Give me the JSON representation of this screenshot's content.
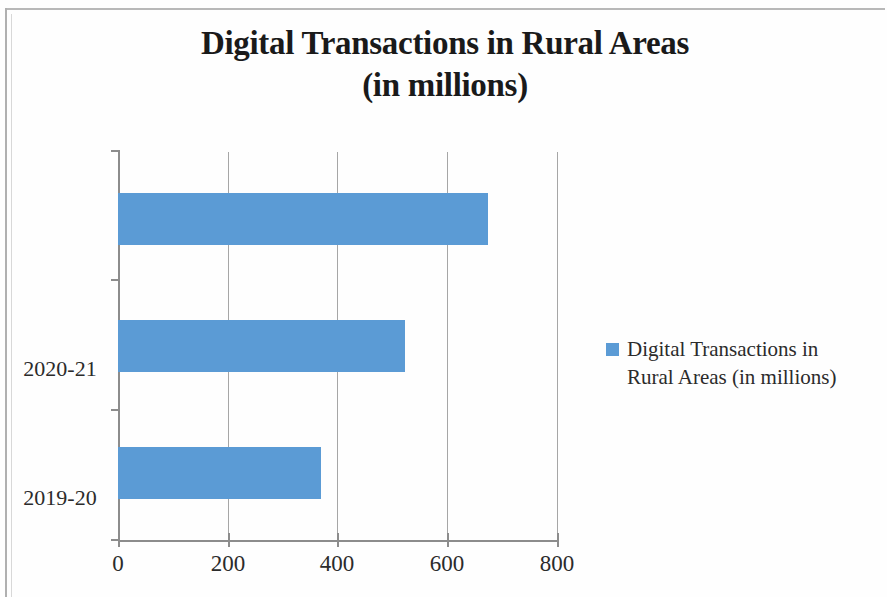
{
  "chart_data": {
    "type": "bar",
    "orientation": "horizontal",
    "title": "Digital Transactions in Rural Areas (in millions)",
    "title_line1": "Digital Transactions in Rural Areas",
    "title_line2": "(in millions)",
    "categories": [
      "2018-19",
      "2019-20",
      "2020-21"
    ],
    "values": [
      370,
      523,
      674
    ],
    "series": [
      {
        "name": "Digital Transactions in Rural Areas (in millions)",
        "values": [
          370,
          523,
          674
        ],
        "color": "#5B9BD5"
      }
    ],
    "xlabel": "",
    "ylabel": "",
    "xlim": [
      0,
      800
    ],
    "xticks": [
      0,
      200,
      400,
      600,
      800
    ],
    "xtick_labels": [
      "0",
      "200",
      "400",
      "600",
      "800"
    ],
    "grid": "vertical",
    "legend": {
      "position": "right",
      "entries": [
        {
          "label_line1": "Digital Transactions in",
          "label_line2": "Rural Areas (in millions)",
          "label": "Digital Transactions in Rural Areas (in millions)",
          "color": "#5B9BD5",
          "marker": "square-swatch"
        }
      ]
    },
    "colors": {
      "bar": "#5B9BD5",
      "axis": "#8C8C8C",
      "gridline": "#A6A6A6",
      "text": "#231F20",
      "background": "#FFFFFF"
    }
  }
}
